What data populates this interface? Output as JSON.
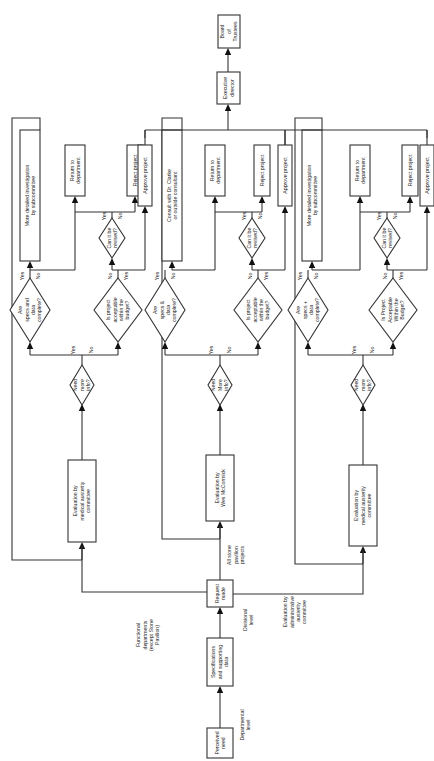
{
  "diagram": {
    "type": "flowchart",
    "orientation": "rotated-90-ccw",
    "start": {
      "perceived_need": [
        "Perceived",
        "need"
      ],
      "departmental_level": [
        "Departmental",
        "level"
      ],
      "specifications": [
        "Specifications",
        "and supporting",
        "data"
      ],
      "request_made": [
        "Request",
        "made"
      ],
      "divisional_level": [
        "Divisional",
        "level"
      ]
    },
    "branch_labels": {
      "functional": [
        "Functional",
        "departments",
        "(except Stone",
        "Pavilion)"
      ],
      "stone": [
        "All stone",
        "pavilion",
        "projects"
      ],
      "admin": [
        "Evaluation by",
        "administrative",
        "austerity",
        "committee"
      ]
    },
    "top": {
      "executive": [
        "Executive",
        "director"
      ],
      "board": [
        "Board",
        "of",
        "Trustees"
      ]
    },
    "lanes": [
      {
        "evaluation": [
          "Evaluation by",
          "medical austerity",
          "committee"
        ],
        "need_info": [
          "Need",
          "more",
          "info?"
        ],
        "specs_q": [
          "Are",
          "specs and",
          "data",
          "complete?"
        ],
        "budget_q": [
          "Is project",
          "acceptable",
          "within the",
          "budget?"
        ],
        "revise_q": [
          "Can it be",
          "revised?"
        ],
        "investigate": [
          "More detailed investigation",
          "by subcommittee"
        ],
        "return": [
          "Return to",
          "department"
        ],
        "reject": [
          "Reject project"
        ],
        "approve": [
          "Approve project"
        ]
      },
      {
        "evaluation": [
          "Evaluation by",
          "Wes McCormick"
        ],
        "need_info": [
          "Need",
          "More",
          "info?"
        ],
        "specs_q": [
          "Are",
          "specs &",
          "data",
          "complete?"
        ],
        "budget_q": [
          "Is project",
          "acceptable",
          "within the",
          "budget?"
        ],
        "revise_q": [
          "Can it be",
          "revised?"
        ],
        "investigate": [
          "Consult with Dr. Clarke",
          "or outside consultant"
        ],
        "return": [
          "Return to",
          "department"
        ],
        "reject": [
          "Reject project"
        ],
        "approve": [
          "Approve project"
        ]
      },
      {
        "evaluation": [
          "Evaluation by",
          "medical austerity",
          "committee"
        ],
        "need_info": [
          "Need",
          "more",
          "info?"
        ],
        "specs_q": [
          "Are",
          "specs +",
          "data",
          "complete?"
        ],
        "budget_q": [
          "Is Project",
          "Acceptable",
          "Within the",
          "Budget?"
        ],
        "revise_q": [
          "Can it be",
          "revised?"
        ],
        "investigate": [
          "More detailed investigation",
          "by subcommittee"
        ],
        "return": [
          "Return to",
          "department"
        ],
        "reject": [
          "Reject project"
        ],
        "approve": [
          "Approve project"
        ]
      }
    ],
    "edge_labels": {
      "yes": "Yes",
      "no": "No"
    }
  }
}
